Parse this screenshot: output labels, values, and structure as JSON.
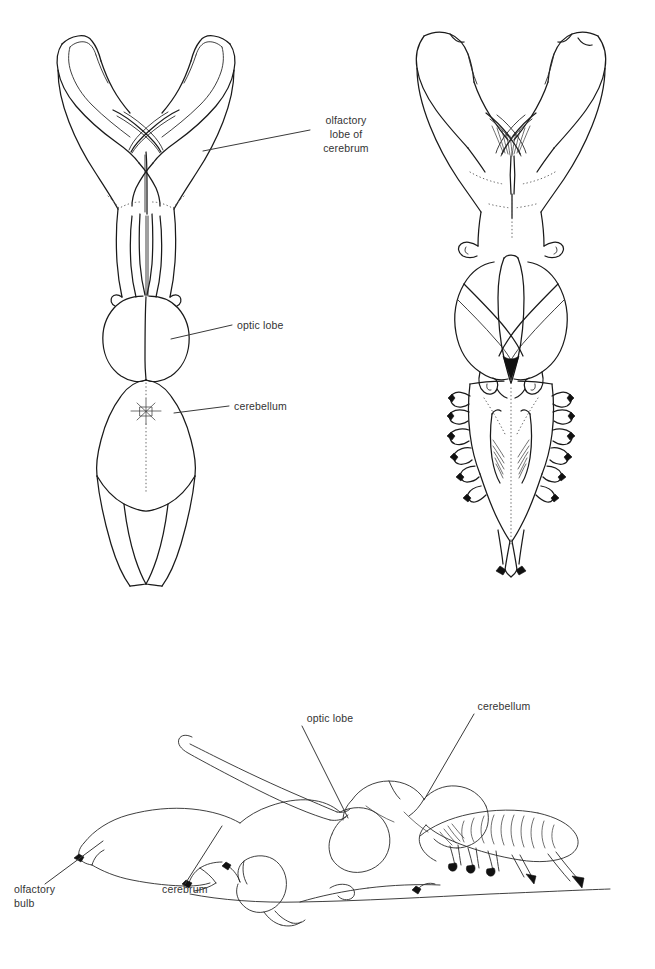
{
  "figure": {
    "background_color": "#ffffff",
    "ink_color": "#1a1a1a",
    "label_color": "#333333",
    "views": [
      {
        "name": "dorsal-view",
        "description": "Dorsal view of brain with olfactory lobes, optic lobes, cerebellum and spinal cord"
      },
      {
        "name": "ventral-view",
        "description": "Ventral view of brain showing optic lobes, cranial nerve roots and medulla"
      },
      {
        "name": "lateral-view",
        "description": "Lateral view of brain showing olfactory bulb, cerebrum, optic lobe and cerebellum"
      }
    ]
  },
  "labels": {
    "olfactory_lobe_of_cerebrum": {
      "line1": "olfactory",
      "line2": "lobe of",
      "line3": "cerebrum"
    },
    "optic_lobe_dorsal": "optic lobe",
    "cerebellum_dorsal": "cerebellum",
    "optic_lobe_lateral": "optic lobe",
    "cerebellum_lateral": "cerebellum",
    "olfactory_bulb": {
      "line1": "olfactory",
      "line2": "bulb"
    },
    "cerebrum_lateral": "cerebrum"
  }
}
